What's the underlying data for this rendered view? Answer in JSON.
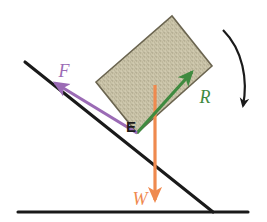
{
  "figure": {
    "background_color": "#ffffff",
    "width": 267,
    "height": 222
  },
  "colors": {
    "friction_purple": "#9b6bb5",
    "normal_green": "#3f8a3f",
    "weight_orange": "#ef8a4f",
    "line_black": "#1a1a1a",
    "block_fill": "#cbc5aa",
    "block_speckle": "#8e876c",
    "block_border": "#6b6550"
  },
  "labels": {
    "friction": "F",
    "normal": "R",
    "weight": "W",
    "contact_point": "E"
  },
  "vectors": [
    {
      "name": "friction-force",
      "symbol": "F",
      "color": "#9b6bb5",
      "direction": "up-the-slope",
      "tail": [
        137,
        133
      ],
      "tip": [
        55,
        83
      ]
    },
    {
      "name": "normal-reaction-force",
      "symbol": "R",
      "color": "#3f8a3f",
      "direction": "perpendicular-to-slope",
      "tail": [
        137,
        133
      ],
      "tip": [
        192,
        72
      ]
    },
    {
      "name": "weight-force",
      "symbol": "W",
      "color": "#ef8a4f",
      "direction": "vertically-downward",
      "tail": [
        155,
        85
      ],
      "tip": [
        155,
        200
      ]
    }
  ],
  "geometry": {
    "incline_line": {
      "start": [
        25,
        62
      ],
      "end": [
        213,
        212
      ]
    },
    "ground_line": {
      "start": [
        18,
        212
      ],
      "end": [
        248,
        212
      ]
    },
    "block_corners": [
      [
        96,
        82
      ],
      [
        172,
        16
      ],
      [
        212,
        66
      ],
      [
        137,
        133
      ]
    ],
    "rotation_arrow": {
      "name": "clockwise-rotation-arrow",
      "color": "#1a1a1a",
      "direction": "clockwise",
      "start": [
        223,
        30
      ],
      "end": [
        243,
        110
      ]
    }
  }
}
